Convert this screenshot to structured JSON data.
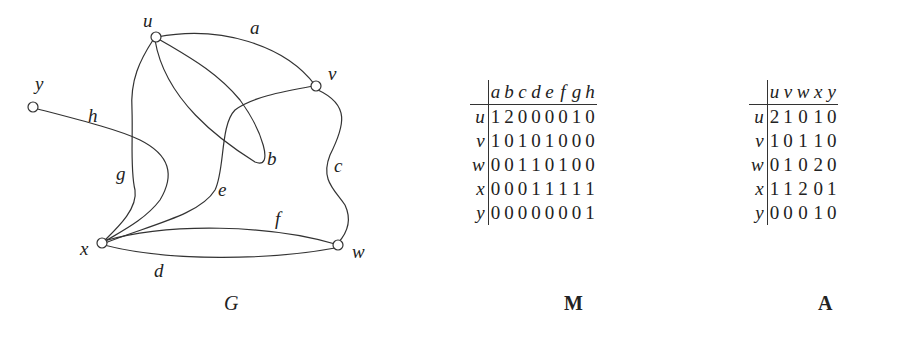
{
  "graph": {
    "caption": "G",
    "vertices": [
      {
        "id": "u",
        "label": "u"
      },
      {
        "id": "v",
        "label": "v"
      },
      {
        "id": "w",
        "label": "w"
      },
      {
        "id": "x",
        "label": "x"
      },
      {
        "id": "y",
        "label": "y"
      }
    ],
    "edges": [
      {
        "id": "a",
        "label": "a",
        "ends": [
          "u",
          "v"
        ]
      },
      {
        "id": "b",
        "label": "b",
        "ends": [
          "u",
          "u"
        ]
      },
      {
        "id": "c",
        "label": "c",
        "ends": [
          "v",
          "w"
        ]
      },
      {
        "id": "d",
        "label": "d",
        "ends": [
          "w",
          "x"
        ]
      },
      {
        "id": "e",
        "label": "e",
        "ends": [
          "v",
          "x"
        ]
      },
      {
        "id": "f",
        "label": "f",
        "ends": [
          "w",
          "x"
        ]
      },
      {
        "id": "g",
        "label": "g",
        "ends": [
          "u",
          "x"
        ]
      },
      {
        "id": "h",
        "label": "h",
        "ends": [
          "x",
          "y"
        ]
      }
    ]
  },
  "incidence_matrix": {
    "caption": "M",
    "columns": [
      "a",
      "b",
      "c",
      "d",
      "e",
      "f",
      "g",
      "h"
    ],
    "rows": [
      {
        "label": "u",
        "values": [
          1,
          2,
          0,
          0,
          0,
          0,
          1,
          0
        ]
      },
      {
        "label": "v",
        "values": [
          1,
          0,
          1,
          0,
          1,
          0,
          0,
          0
        ]
      },
      {
        "label": "w",
        "values": [
          0,
          0,
          1,
          1,
          0,
          1,
          0,
          0
        ]
      },
      {
        "label": "x",
        "values": [
          0,
          0,
          0,
          1,
          1,
          1,
          1,
          1
        ]
      },
      {
        "label": "y",
        "values": [
          0,
          0,
          0,
          0,
          0,
          0,
          0,
          1
        ]
      }
    ]
  },
  "adjacency_matrix": {
    "caption": "A",
    "columns": [
      "u",
      "v",
      "w",
      "x",
      "y"
    ],
    "rows": [
      {
        "label": "u",
        "values": [
          2,
          1,
          0,
          1,
          0
        ]
      },
      {
        "label": "v",
        "values": [
          1,
          0,
          1,
          1,
          0
        ]
      },
      {
        "label": "w",
        "values": [
          0,
          1,
          0,
          2,
          0
        ]
      },
      {
        "label": "x",
        "values": [
          1,
          1,
          2,
          0,
          1
        ]
      },
      {
        "label": "y",
        "values": [
          0,
          0,
          0,
          1,
          0
        ]
      }
    ]
  }
}
